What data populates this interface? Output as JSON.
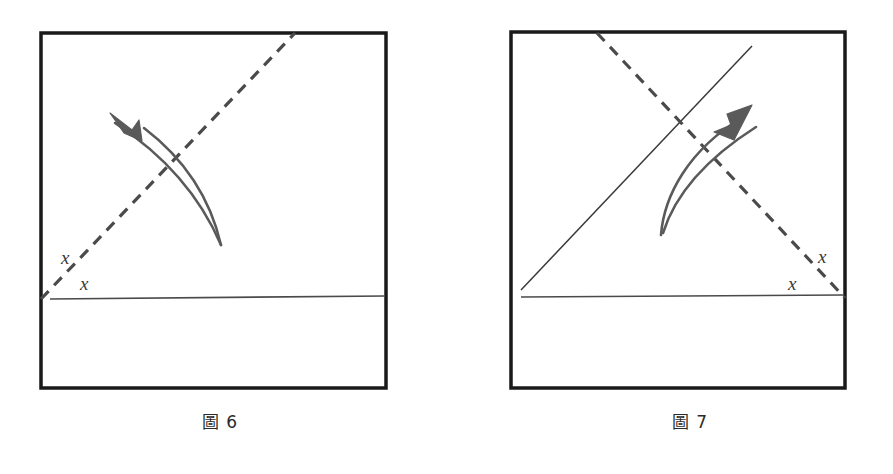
{
  "page": {
    "background_color": "#ffffff",
    "width": 893,
    "height": 474
  },
  "figures": [
    {
      "id": "figure-6",
      "caption": "圖 6",
      "caption_label": "圖",
      "caption_number": "6",
      "frame": {
        "x": 31,
        "y": 33,
        "width": 345,
        "height": 355,
        "stroke_color": "#1a1a1a",
        "stroke_width": 3.5
      },
      "dashed_line": {
        "name": "fold-crease-dashed-diagonal",
        "x1": 31,
        "y1": 299,
        "x2": 285,
        "y2": 33,
        "stroke_color": "#4a4a4a",
        "stroke_width": 3.2,
        "dash": "11 8"
      },
      "horizontal_line": {
        "name": "horizontal-edge-line",
        "x1": 40,
        "y1": 299,
        "x2": 375,
        "y2": 296,
        "stroke_color": "#4a4a4a",
        "stroke_width": 1.6
      },
      "labels": [
        {
          "text": "x",
          "x": 51,
          "y": 264
        },
        {
          "text": "x",
          "x": 70,
          "y": 288
        }
      ],
      "arrow": {
        "name": "fold-motion-arrow",
        "direction": "up-left",
        "color": "#5a5a5a",
        "stroke_width": 2.6,
        "outer_path": "M 211 245 C 196 210, 168 164, 105 123",
        "inner_path": "M 211 245 C 202 206, 180 163, 134 128",
        "head_tip_x": 100,
        "head_tip_y": 113,
        "head_path": "M 100 113 L 120 128 L 130 121 L 131 138 L 116 131 Z"
      }
    },
    {
      "id": "figure-7",
      "caption": "圖 7",
      "caption_label": "圖",
      "caption_number": "7",
      "frame": {
        "x": 31,
        "y": 32,
        "width": 334,
        "height": 356,
        "stroke_color": "#1a1a1a",
        "stroke_width": 3.5
      },
      "solid_diagonal": {
        "name": "fold-crease-solid-diagonal",
        "x1": 41,
        "y1": 290,
        "x2": 272,
        "y2": 46,
        "stroke_color": "#3a3a3a",
        "stroke_width": 1.5
      },
      "dashed_line": {
        "name": "fold-crease-dashed-diagonal",
        "x1": 117,
        "y1": 33,
        "x2": 365,
        "y2": 298,
        "stroke_color": "#4a4a4a",
        "stroke_width": 3.2,
        "dash": "11 8"
      },
      "horizontal_line": {
        "name": "horizontal-edge-line",
        "x1": 41,
        "y1": 297,
        "x2": 363,
        "y2": 295,
        "stroke_color": "#4a4a4a",
        "stroke_width": 1.6
      },
      "labels": [
        {
          "text": "x",
          "x": 340,
          "y": 262
        },
        {
          "text": "x",
          "x": 310,
          "y": 288
        }
      ],
      "arrow": {
        "name": "fold-motion-arrow",
        "direction": "up-right",
        "color": "#5a5a5a",
        "stroke_width": 2.6,
        "outer_path": "M 181 235 C 184 196, 208 150, 263 117",
        "inner_path": "M 181 235 C 192 198, 219 160, 276 127",
        "head_tip_x": 272,
        "head_tip_y": 105,
        "head_path": "M 272 105 L 248 115 L 250 126 L 236 135 L 253 139 Z"
      }
    }
  ]
}
